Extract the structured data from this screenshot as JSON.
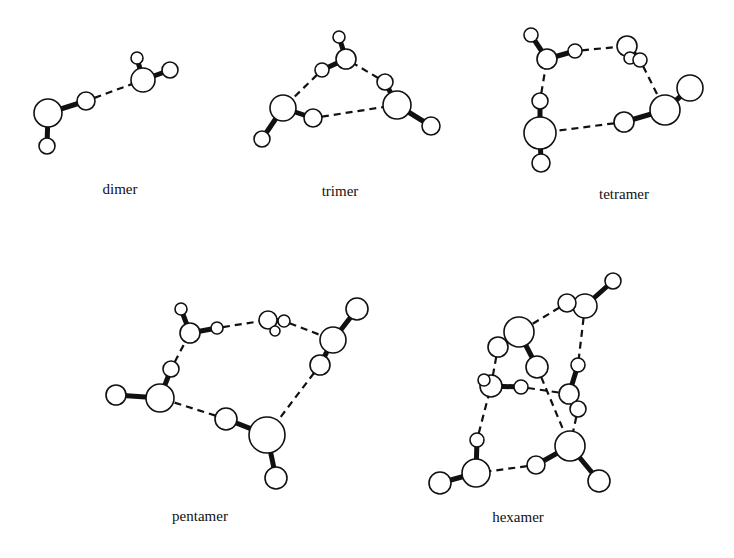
{
  "figure": {
    "title": "",
    "clusters": [
      {
        "id": "dimer",
        "label": "dimer",
        "label_pos": [
          120,
          194
        ],
        "atoms": [
          {
            "x": 48,
            "y": 113,
            "r": 14,
            "el": "O"
          },
          {
            "x": 47,
            "y": 146,
            "r": 8,
            "el": "H"
          },
          {
            "x": 86,
            "y": 101,
            "r": 9,
            "el": "H"
          },
          {
            "x": 143,
            "y": 80,
            "r": 12,
            "el": "O"
          },
          {
            "x": 137,
            "y": 58,
            "r": 6,
            "el": "H"
          },
          {
            "x": 170,
            "y": 70,
            "r": 8,
            "el": "H"
          }
        ],
        "bonds": [
          [
            0,
            1
          ],
          [
            0,
            2
          ],
          [
            3,
            4
          ],
          [
            3,
            5
          ]
        ],
        "hbonds": [
          [
            2,
            3
          ]
        ]
      },
      {
        "id": "trimer",
        "label": "trimer",
        "label_pos": [
          340,
          196
        ],
        "atoms": [
          {
            "x": 283,
            "y": 108,
            "r": 13,
            "el": "O"
          },
          {
            "x": 262,
            "y": 139,
            "r": 8,
            "el": "H"
          },
          {
            "x": 313,
            "y": 118,
            "r": 9,
            "el": "H"
          },
          {
            "x": 346,
            "y": 59,
            "r": 10,
            "el": "O"
          },
          {
            "x": 339,
            "y": 37,
            "r": 6,
            "el": "H"
          },
          {
            "x": 322,
            "y": 70,
            "r": 7,
            "el": "H"
          },
          {
            "x": 397,
            "y": 105,
            "r": 14,
            "el": "O"
          },
          {
            "x": 385,
            "y": 82,
            "r": 8,
            "el": "H"
          },
          {
            "x": 431,
            "y": 126,
            "r": 9,
            "el": "H"
          }
        ],
        "bonds": [
          [
            0,
            1
          ],
          [
            0,
            2
          ],
          [
            3,
            4
          ],
          [
            3,
            5
          ],
          [
            6,
            7
          ],
          [
            6,
            8
          ]
        ],
        "hbonds": [
          [
            2,
            6
          ],
          [
            5,
            0
          ],
          [
            7,
            3
          ]
        ]
      },
      {
        "id": "tetramer",
        "label": "tetramer",
        "label_pos": [
          624,
          199
        ],
        "atoms": [
          {
            "x": 547,
            "y": 59,
            "r": 10,
            "el": "O"
          },
          {
            "x": 531,
            "y": 35,
            "r": 7,
            "el": "H"
          },
          {
            "x": 575,
            "y": 51,
            "r": 7,
            "el": "H"
          },
          {
            "x": 627,
            "y": 46,
            "r": 10,
            "el": "O"
          },
          {
            "x": 630,
            "y": 58,
            "r": 6,
            "el": "H"
          },
          {
            "x": 640,
            "y": 60,
            "r": 7,
            "el": "H"
          },
          {
            "x": 665,
            "y": 110,
            "r": 15,
            "el": "O"
          },
          {
            "x": 690,
            "y": 88,
            "r": 13,
            "el": "H"
          },
          {
            "x": 624,
            "y": 122,
            "r": 10,
            "el": "H"
          },
          {
            "x": 540,
            "y": 133,
            "r": 16,
            "el": "O"
          },
          {
            "x": 540,
            "y": 101,
            "r": 8,
            "el": "H"
          },
          {
            "x": 541,
            "y": 163,
            "r": 9,
            "el": "H"
          }
        ],
        "bonds": [
          [
            0,
            1
          ],
          [
            0,
            2
          ],
          [
            3,
            4
          ],
          [
            3,
            5
          ],
          [
            6,
            7
          ],
          [
            6,
            8
          ],
          [
            9,
            10
          ],
          [
            9,
            11
          ]
        ],
        "hbonds": [
          [
            2,
            3
          ],
          [
            5,
            6
          ],
          [
            8,
            9
          ],
          [
            10,
            0
          ]
        ]
      },
      {
        "id": "pentamer",
        "label": "pentamer",
        "label_pos": [
          200,
          521
        ],
        "atoms": [
          {
            "x": 190,
            "y": 333,
            "r": 10,
            "el": "O"
          },
          {
            "x": 181,
            "y": 309,
            "r": 6,
            "el": "H"
          },
          {
            "x": 217,
            "y": 328,
            "r": 6,
            "el": "H"
          },
          {
            "x": 268,
            "y": 320,
            "r": 9,
            "el": "O"
          },
          {
            "x": 284,
            "y": 321,
            "r": 6,
            "el": "H"
          },
          {
            "x": 275,
            "y": 331,
            "r": 5,
            "el": "H"
          },
          {
            "x": 333,
            "y": 340,
            "r": 13,
            "el": "O"
          },
          {
            "x": 357,
            "y": 309,
            "r": 11,
            "el": "H"
          },
          {
            "x": 320,
            "y": 365,
            "r": 10,
            "el": "H"
          },
          {
            "x": 267,
            "y": 435,
            "r": 18,
            "el": "O"
          },
          {
            "x": 276,
            "y": 478,
            "r": 11,
            "el": "H"
          },
          {
            "x": 226,
            "y": 419,
            "r": 11,
            "el": "H"
          },
          {
            "x": 160,
            "y": 398,
            "r": 14,
            "el": "O"
          },
          {
            "x": 116,
            "y": 395,
            "r": 10,
            "el": "H"
          },
          {
            "x": 171,
            "y": 369,
            "r": 8,
            "el": "H"
          }
        ],
        "bonds": [
          [
            0,
            1
          ],
          [
            0,
            2
          ],
          [
            3,
            4
          ],
          [
            3,
            5
          ],
          [
            6,
            7
          ],
          [
            6,
            8
          ],
          [
            9,
            10
          ],
          [
            9,
            11
          ],
          [
            12,
            13
          ],
          [
            12,
            14
          ]
        ],
        "hbonds": [
          [
            2,
            3
          ],
          [
            4,
            6
          ],
          [
            8,
            9
          ],
          [
            11,
            12
          ],
          [
            14,
            0
          ]
        ]
      },
      {
        "id": "hexamer",
        "label": "hexamer",
        "label_pos": [
          518,
          522
        ],
        "atoms": [
          {
            "x": 519,
            "y": 332,
            "r": 15,
            "el": "O"
          },
          {
            "x": 498,
            "y": 347,
            "r": 10,
            "el": "H"
          },
          {
            "x": 537,
            "y": 367,
            "r": 11,
            "el": "H"
          },
          {
            "x": 585,
            "y": 306,
            "r": 12,
            "el": "O"
          },
          {
            "x": 567,
            "y": 303,
            "r": 9,
            "el": "H"
          },
          {
            "x": 613,
            "y": 281,
            "r": 8,
            "el": "H"
          },
          {
            "x": 491,
            "y": 386,
            "r": 11,
            "el": "O"
          },
          {
            "x": 484,
            "y": 380,
            "r": 6,
            "el": "H"
          },
          {
            "x": 521,
            "y": 387,
            "r": 7,
            "el": "H"
          },
          {
            "x": 569,
            "y": 394,
            "r": 10,
            "el": "O"
          },
          {
            "x": 578,
            "y": 365,
            "r": 7,
            "el": "H"
          },
          {
            "x": 578,
            "y": 409,
            "r": 8,
            "el": "H"
          },
          {
            "x": 570,
            "y": 446,
            "r": 15,
            "el": "O"
          },
          {
            "x": 536,
            "y": 465,
            "r": 9,
            "el": "H"
          },
          {
            "x": 599,
            "y": 481,
            "r": 11,
            "el": "H"
          },
          {
            "x": 476,
            "y": 473,
            "r": 14,
            "el": "O"
          },
          {
            "x": 477,
            "y": 440,
            "r": 7,
            "el": "H"
          },
          {
            "x": 440,
            "y": 483,
            "r": 11,
            "el": "H"
          }
        ],
        "bonds": [
          [
            0,
            1
          ],
          [
            0,
            2
          ],
          [
            3,
            4
          ],
          [
            3,
            5
          ],
          [
            6,
            7
          ],
          [
            6,
            8
          ],
          [
            9,
            10
          ],
          [
            9,
            11
          ],
          [
            12,
            13
          ],
          [
            12,
            14
          ],
          [
            15,
            16
          ],
          [
            15,
            17
          ]
        ],
        "hbonds": [
          [
            4,
            0
          ],
          [
            3,
            10
          ],
          [
            1,
            6
          ],
          [
            8,
            9
          ],
          [
            2,
            12
          ],
          [
            11,
            12
          ],
          [
            13,
            15
          ],
          [
            16,
            6
          ]
        ]
      }
    ]
  }
}
